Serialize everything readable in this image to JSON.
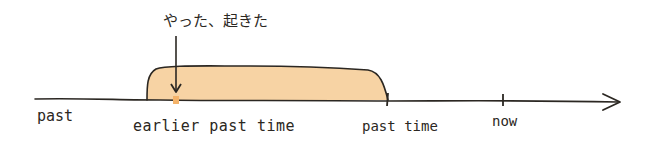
{
  "diagram": {
    "type": "timeline",
    "annotation": "やった、起きた",
    "labels": {
      "past": "past",
      "earlier_past_time": "earlier past time",
      "past_time": "past time",
      "now": "now"
    },
    "colors": {
      "line": "#2b2722",
      "shaded_region": "#f7d3a4",
      "marker": "#f4b36a",
      "background": "#ffffff"
    },
    "elements": [
      {
        "kind": "axis-arrow",
        "direction": "right"
      },
      {
        "kind": "shaded-region",
        "from": "earlier past time",
        "to": "past time"
      },
      {
        "kind": "point-marker",
        "at": "earlier past time"
      },
      {
        "kind": "tick",
        "at": "past time"
      },
      {
        "kind": "tick",
        "at": "now"
      },
      {
        "kind": "pointer-arrow",
        "from": "annotation",
        "to": "earlier past time"
      }
    ]
  }
}
